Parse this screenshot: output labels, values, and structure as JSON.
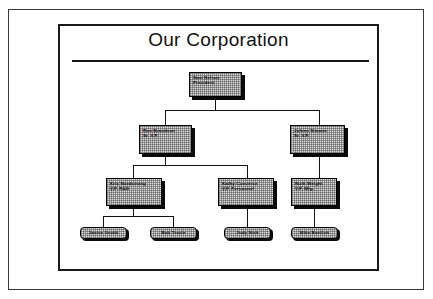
{
  "document": {
    "title": "Our Corporation"
  },
  "org_chart": {
    "type": "organizational-chart",
    "levels": 4,
    "nodes": [
      {
        "id": "president",
        "name": "Sam Nelson",
        "role": "President",
        "level": 1,
        "parent": null
      },
      {
        "id": "svp-left",
        "name": "Ron Brandson",
        "role": "Sr. V.P.",
        "level": 2,
        "parent": "president"
      },
      {
        "id": "svp-right",
        "name": "Juleen Simons",
        "role": "Sr. V.P.",
        "level": 2,
        "parent": "president"
      },
      {
        "id": "vp-rd",
        "name": "Kris Nordstrong",
        "role": "V.P. R&D",
        "level": 3,
        "parent": "svp-left"
      },
      {
        "id": "vp-pers",
        "name": "Kathy Converse",
        "role": "V.P. Personnel",
        "level": 3,
        "parent": "svp-left"
      },
      {
        "id": "vp-mfg",
        "name": "Ruth Weight",
        "role": "V.P. Mfg.",
        "level": 3,
        "parent": "svp-right"
      },
      {
        "id": "staff-1",
        "name": "Janice Grubb",
        "role": "",
        "level": 4,
        "parent": "vp-rd"
      },
      {
        "id": "staff-2",
        "name": "Bob Trusle",
        "role": "",
        "level": 4,
        "parent": "vp-rd"
      },
      {
        "id": "staff-3",
        "name": "Judy Nish",
        "role": "",
        "level": 4,
        "parent": "vp-pers"
      },
      {
        "id": "staff-4",
        "name": "Mike Bartlich",
        "role": "",
        "level": 4,
        "parent": "vp-mfg"
      }
    ]
  },
  "colors": {
    "box_fill": "#d9d9d9",
    "box_border": "#000000",
    "box_shadow": "#0b0b0b",
    "line": "#111111",
    "text": "#0a0a0a",
    "frame": "#1a1a1a",
    "page_border": "#3a3a3a",
    "background": "#ffffff"
  }
}
